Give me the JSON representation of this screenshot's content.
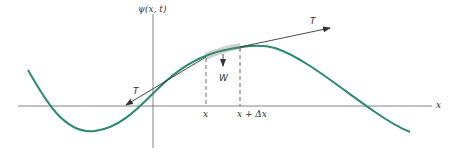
{
  "figure": {
    "y_axis_label": "ψ(x, t)",
    "x_axis_label": "x",
    "tension_label_right": "T",
    "tension_label_left": "T",
    "weight_label": "W",
    "point_x_label": "x",
    "point_x_dx_label": "x + Δx",
    "colors": {
      "curve": "#2a8a6a",
      "axes": "#555555",
      "shaded_segment": "#c8c8c8",
      "vectors": "#333333"
    }
  }
}
